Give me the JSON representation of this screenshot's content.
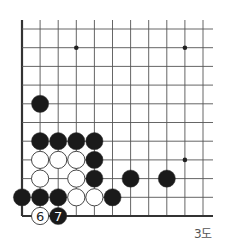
{
  "diagram": {
    "type": "go-board-corner",
    "caption": "3도",
    "grid": {
      "origin_x": 22,
      "origin_y": 216,
      "col_spacing": 18.1,
      "row_spacing": 18.7,
      "cols": 11,
      "rows": 11,
      "extend_right": 213,
      "extend_top": 20,
      "edges": [
        "left",
        "bottom"
      ]
    },
    "star_points": [
      {
        "col": 3,
        "row": 9
      },
      {
        "col": 9,
        "row": 9
      },
      {
        "col": 9,
        "row": 3
      }
    ],
    "stones": [
      {
        "color": "black",
        "col": 1,
        "row": 6
      },
      {
        "color": "black",
        "col": 1,
        "row": 4
      },
      {
        "color": "black",
        "col": 2,
        "row": 4
      },
      {
        "color": "black",
        "col": 3,
        "row": 4
      },
      {
        "color": "black",
        "col": 4,
        "row": 4
      },
      {
        "color": "white",
        "col": 1,
        "row": 3
      },
      {
        "color": "white",
        "col": 2,
        "row": 3
      },
      {
        "color": "white",
        "col": 3,
        "row": 3
      },
      {
        "color": "black",
        "col": 4,
        "row": 3
      },
      {
        "color": "white",
        "col": 1,
        "row": 2
      },
      {
        "color": "white",
        "col": 3,
        "row": 2
      },
      {
        "color": "black",
        "col": 4,
        "row": 2
      },
      {
        "color": "black",
        "col": 6,
        "row": 2
      },
      {
        "color": "black",
        "col": 8,
        "row": 2
      },
      {
        "color": "black",
        "col": 0,
        "row": 1
      },
      {
        "color": "black",
        "col": 1,
        "row": 1
      },
      {
        "color": "black",
        "col": 2,
        "row": 1
      },
      {
        "color": "white",
        "col": 3,
        "row": 1
      },
      {
        "color": "white",
        "col": 4,
        "row": 1
      },
      {
        "color": "black",
        "col": 5,
        "row": 1
      },
      {
        "color": "white",
        "col": 1,
        "row": 0,
        "label": "6"
      },
      {
        "color": "black",
        "col": 2,
        "row": 0,
        "label": "7"
      }
    ],
    "colors": {
      "line": "#555555",
      "edge": "#333333",
      "black_stone": "#1a1a1a",
      "white_stone": "#ffffff",
      "stone_outline": "#333333"
    }
  }
}
